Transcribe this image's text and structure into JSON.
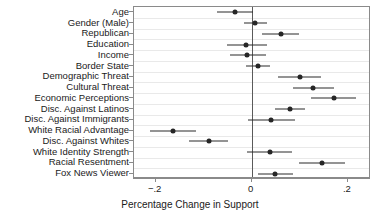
{
  "chart_data": {
    "type": "scatter",
    "title": "",
    "xlabel": "Percentage Change in Support",
    "ylabel": "",
    "xlim": [
      -0.245,
      0.248
    ],
    "grid": true,
    "legend": null,
    "orientation": "horizontal",
    "marker": "filled-circle",
    "reference_line": 0,
    "xticks": [
      -0.2,
      0,
      0.2
    ],
    "xticklabels": [
      "−.2",
      "0",
      ".2"
    ],
    "categories": [
      "Age",
      "Gender (Male)",
      "Republican",
      "Education",
      "Income",
      "Border State",
      "Demographic Threat",
      "Cultural Threat",
      "Economic Perceptions",
      "Disc. Against Latinos",
      "Disc. Against Immigrants",
      "White Racial Advantage",
      "Disc. Against Whites",
      "White Identity Strength",
      "Racial Resentment",
      "Fox News Viewer"
    ],
    "points": [
      {
        "label": "Age",
        "estimate": -0.035,
        "ci_low": -0.073,
        "ci_high": 0.002
      },
      {
        "label": "Gender (Male)",
        "estimate": 0.006,
        "ci_low": -0.016,
        "ci_high": 0.031
      },
      {
        "label": "Republican",
        "estimate": 0.061,
        "ci_low": 0.022,
        "ci_high": 0.098
      },
      {
        "label": "Education",
        "estimate": -0.011,
        "ci_low": -0.052,
        "ci_high": 0.032
      },
      {
        "label": "Income",
        "estimate": -0.009,
        "ci_low": -0.045,
        "ci_high": 0.029
      },
      {
        "label": "Border State",
        "estimate": 0.012,
        "ci_low": -0.013,
        "ci_high": 0.038
      },
      {
        "label": "Demographic Threat",
        "estimate": 0.101,
        "ci_low": 0.055,
        "ci_high": 0.145
      },
      {
        "label": "Cultural Threat",
        "estimate": 0.127,
        "ci_low": 0.085,
        "ci_high": 0.17
      },
      {
        "label": "Economic Perceptions",
        "estimate": 0.17,
        "ci_low": 0.124,
        "ci_high": 0.216
      },
      {
        "label": "Disc. Against Latinos",
        "estimate": 0.079,
        "ci_low": 0.048,
        "ci_high": 0.111
      },
      {
        "label": "Disc. Against Immigrants",
        "estimate": 0.041,
        "ci_low": -0.007,
        "ci_high": 0.089
      },
      {
        "label": "White Racial Advantage",
        "estimate": -0.163,
        "ci_low": -0.212,
        "ci_high": -0.115
      },
      {
        "label": "Disc. Against Whites",
        "estimate": -0.09,
        "ci_low": -0.13,
        "ci_high": -0.05
      },
      {
        "label": "White Identity Strength",
        "estimate": 0.037,
        "ci_low": -0.009,
        "ci_high": 0.084
      },
      {
        "label": "Racial Resentment",
        "estimate": 0.146,
        "ci_low": 0.099,
        "ci_high": 0.193
      },
      {
        "label": "Fox News Viewer",
        "estimate": 0.048,
        "ci_low": 0.012,
        "ci_high": 0.085
      }
    ],
    "colors": {
      "marker": "#262626",
      "whisker": "#2b2b2b",
      "grid": "#e9e9e9",
      "frame": "#8a8a8a",
      "zero_line": "#5a5a5a",
      "background": "#ffffff",
      "text": "#1a1a1a"
    }
  }
}
